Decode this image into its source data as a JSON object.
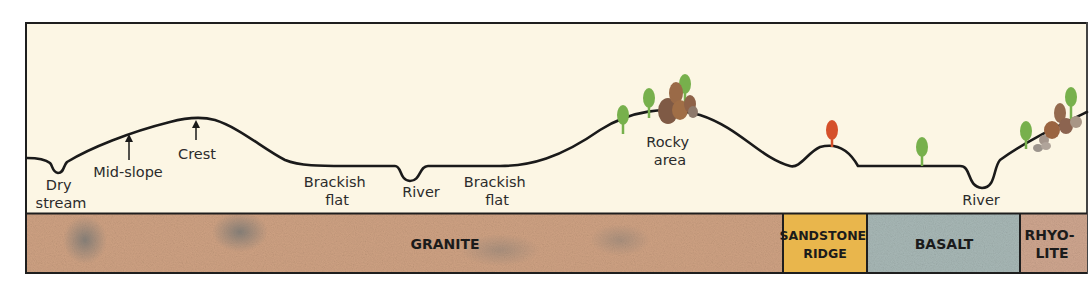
{
  "diagram": {
    "colors": {
      "sky": "#fcf6e4",
      "frame": "#1e1e1e",
      "granite": "#cfa283",
      "sandstone": "#e9b64c",
      "basalt": "#a8b8b6",
      "rhyolite": "#cfa68f",
      "tree_green": "#77b04c",
      "tree_red": "#d5502a",
      "rock_brown": "#9a6a47"
    },
    "landform_labels": {
      "dry_stream_1": "Dry",
      "dry_stream_2": "stream",
      "mid_slope": "Mid-slope",
      "crest": "Crest",
      "brackish_flat_a_1": "Brackish",
      "brackish_flat_a_2": "flat",
      "river_a": "River",
      "brackish_flat_b_1": "Brackish",
      "brackish_flat_b_2": "flat",
      "rocky_area_1": "Rocky",
      "rocky_area_2": "area",
      "river_b": "River"
    },
    "bedrock": [
      {
        "name": "GRANITE"
      },
      {
        "name_1": "SANDSTONE",
        "name_2": "RIDGE"
      },
      {
        "name": "BASALT"
      },
      {
        "name_1": "RHYO-",
        "name_2": "LITE"
      }
    ]
  }
}
